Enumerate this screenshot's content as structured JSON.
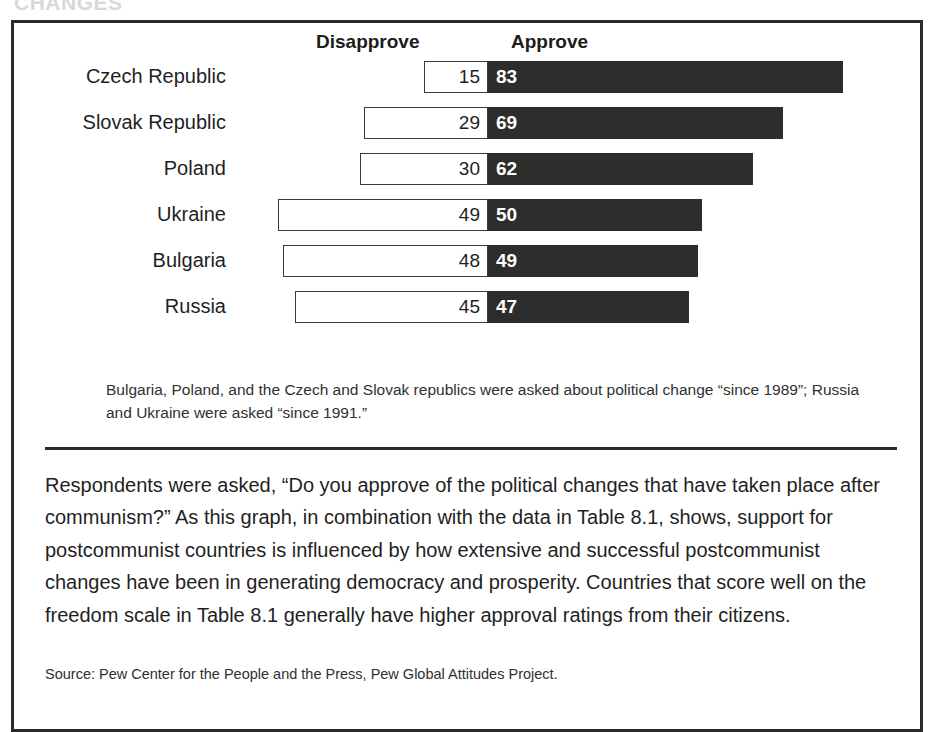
{
  "ghost_heading": "CHANGES",
  "chart_data": {
    "type": "bar",
    "subtype": "diverging-horizontal",
    "title": "",
    "xlabel": "",
    "ylabel": "",
    "grid": false,
    "legend_position": "top",
    "axis_center_value": 0,
    "scale_px_per_unit": 4.28,
    "categories": [
      "Czech Republic",
      "Slovak Republic",
      "Poland",
      "Ukraine",
      "Bulgaria",
      "Russia"
    ],
    "series": [
      {
        "name": "Disapprove",
        "values": [
          15,
          29,
          30,
          49,
          48,
          45
        ]
      },
      {
        "name": "Approve",
        "values": [
          83,
          69,
          62,
          50,
          49,
          47
        ]
      }
    ],
    "rows": [
      {
        "label": "Czech Republic",
        "disapprove": 15,
        "approve": 83
      },
      {
        "label": "Slovak Republic",
        "disapprove": 29,
        "approve": 69
      },
      {
        "label": "Poland",
        "disapprove": 30,
        "approve": 62
      },
      {
        "label": "Ukraine",
        "disapprove": 49,
        "approve": 50
      },
      {
        "label": "Bulgaria",
        "disapprove": 48,
        "approve": 49
      },
      {
        "label": "Russia",
        "disapprove": 45,
        "approve": 47
      }
    ]
  },
  "headers": {
    "disapprove": "Disapprove",
    "approve": "Approve"
  },
  "footnote": "Bulgaria, Poland, and the Czech and Slovak republics were asked about political change “since 1989”; Russia and Ukraine were asked “since 1991.”",
  "body": "Respondents were asked, “Do you approve of the political changes that have taken place after communism?” As this graph, in combination with the data in Table 8.1, shows, support for postcommunist countries is influenced by how extensive and successful postcommunist changes have been in generating democracy and prosperity. Countries that score well on the freedom scale in Table 8.1 generally have higher approval ratings from their citizens.",
  "source": "Source: Pew Center for the People and the Press, Pew Global Attitudes Project.",
  "colors": {
    "approve_bar": "#2d2d2d",
    "disapprove_bar": "#ffffff",
    "bar_outline": "#3a3a3a",
    "frame": "#2b2b2b",
    "text": "#1f1f1f"
  }
}
